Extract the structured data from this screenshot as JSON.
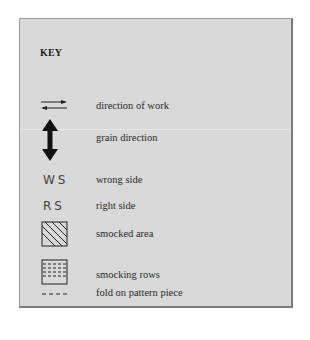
{
  "key": {
    "title": "KEY",
    "items": [
      {
        "icon": "direction-of-work-arrows-icon",
        "label": "direction of work"
      },
      {
        "icon": "grain-direction-double-arrow-icon",
        "label": "grain direction"
      },
      {
        "icon": "ws-abbreviation",
        "symbol_text": "WS",
        "label": "wrong side"
      },
      {
        "icon": "rs-abbreviation",
        "symbol_text": "RS",
        "label": "right side"
      },
      {
        "icon": "diagonal-hatched-square-icon",
        "label": "smocked area"
      },
      {
        "icon": "dashed-rows-square-icon",
        "label": "smocking rows"
      },
      {
        "icon": "dashed-line-icon",
        "label": "fold on pattern piece"
      }
    ]
  },
  "colors": {
    "panel_background": "#d9d9d9",
    "border": "#7a7a7a",
    "ink": "#222222"
  }
}
